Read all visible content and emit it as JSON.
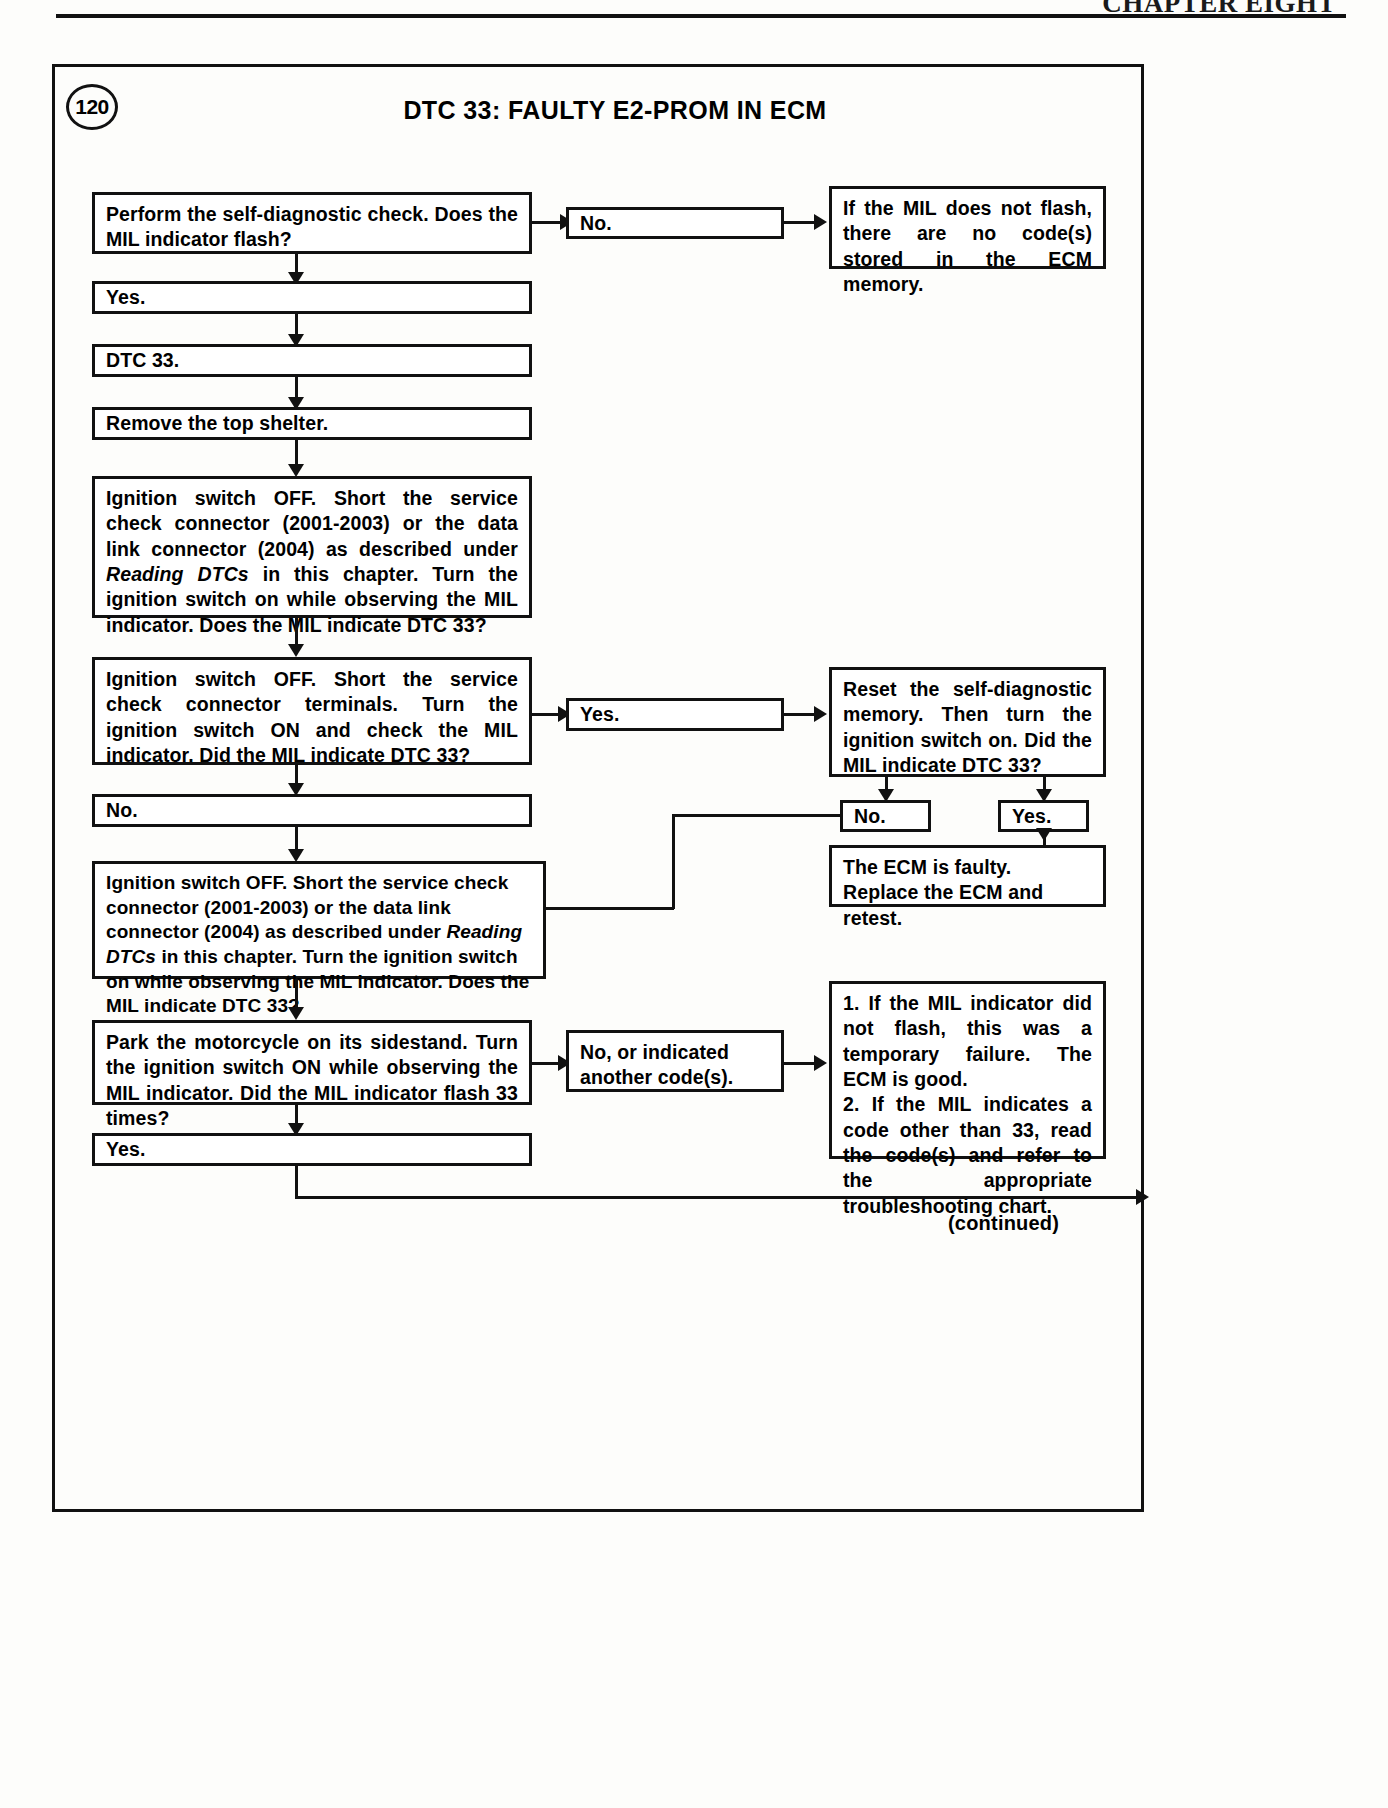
{
  "page": {
    "running_head": "CHAPTER EIGHT",
    "figure_number": "120",
    "chart_title": "DTC 33: FAULTY E2-PROM IN ECM",
    "continued_label": "(continued)"
  },
  "boxes": {
    "b1_perform_check": "Perform the self-diagnostic check. Does the MIL indicator flash?",
    "b1_no": "No.",
    "b1_result": "If the MIL does not flash, there are no code(s) stored in the ECM memory.",
    "b2_yes": "Yes.",
    "b3_dtc33": "DTC 33.",
    "b4_remove_shelter": "Remove the top shelter.",
    "b5_ignition_long_a": "Ignition switch OFF. Short the service check connector (2001-2003) or the data link connector (2004) as described under ",
    "b5_ignition_long_a_italic": "Reading DTCs",
    "b5_ignition_long_b": " in this chapter. Turn the ignition switch on while observing the MIL indicator. Does the MIL indicate DTC 33?",
    "b6_ignition_terminals": "Ignition switch OFF. Short the service check connector terminals. Turn the ignition switch ON and check the MIL indicator. Did the MIL indicate DTC 33?",
    "b6_yes": "Yes.",
    "b7_reset": "Reset the self-diagnostic memory. Then turn the ignition switch on. Did the MIL indicate DTC 33?",
    "b7_no": "No.",
    "b7_yes": "Yes.",
    "b8_ecm_faulty": "The ECM is faulty. Replace the ECM and retest.",
    "b9_no": "No.",
    "b10_ignition_long_a": "Ignition switch OFF. Short the service check connector (2001-2003) or the data link connector (2004) as described under ",
    "b10_ignition_long_a_italic": "Reading DTCs",
    "b10_ignition_long_b": " in this chapter. Turn the ignition switch on while observing the MIL indicator. Does the MIL indicate DTC 33?",
    "b11_park": "Park the motorcycle on its sidestand. Turn the ignition switch ON while observing the MIL indicator. Did the MIL indicator flash 33 times?",
    "b11_no_other": "No, or indicated another code(s).",
    "b12_numbered_1": "1. If the MIL indicator did not flash, this was a temporary failure. The ECM is good.",
    "b12_numbered_2": "2. If the MIL indicates a code other than 33, read the code(s) and refer to the appropriate troubleshooting chart.",
    "b13_yes": "Yes."
  },
  "colors": {
    "ink": "#111111",
    "paper": "#fdfdfb"
  }
}
